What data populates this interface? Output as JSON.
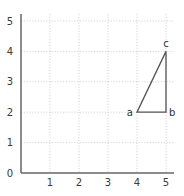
{
  "chart_data": {
    "type": "line",
    "title": "",
    "xlabel": "",
    "ylabel": "",
    "xlim": [
      0,
      5
    ],
    "ylim": [
      0,
      5
    ],
    "grid": true,
    "x_ticks": [
      "1",
      "2",
      "3",
      "4",
      "5"
    ],
    "y_ticks": [
      "0",
      "1",
      "2",
      "3",
      "4",
      "5"
    ],
    "series": [
      {
        "name": "triangle",
        "closed": true,
        "points": [
          {
            "label": "a",
            "x": 4,
            "y": 2
          },
          {
            "label": "b",
            "x": 5,
            "y": 2
          },
          {
            "label": "c",
            "x": 5,
            "y": 4
          }
        ]
      }
    ],
    "legend": null
  },
  "colors": {
    "axis": "#666666",
    "grid": "#c9c9c9",
    "shape": "#555555",
    "text": "#3a3a3a"
  }
}
